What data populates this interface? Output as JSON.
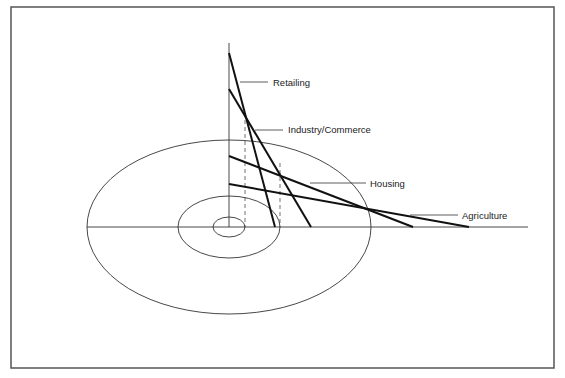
{
  "diagram": {
    "colors": {
      "frame": "#555555",
      "line": "#111111",
      "thin": "#333333"
    },
    "curves": [
      {
        "label": "Retailing",
        "x1": 229,
        "y1": 53,
        "x2": 275,
        "y2": 227,
        "lx1": 240,
        "ly1": 82,
        "lx2": 268,
        "ly2": 82,
        "tx": 273,
        "ty": 86
      },
      {
        "label": "Industry/Commerce",
        "x1": 229,
        "y1": 89,
        "x2": 311,
        "y2": 227,
        "lx1": 255,
        "ly1": 130,
        "lx2": 283,
        "ly2": 130,
        "tx": 288,
        "ty": 133
      },
      {
        "label": "Housing",
        "x1": 229,
        "y1": 156,
        "x2": 413,
        "y2": 227,
        "lx1": 310,
        "ly1": 183,
        "lx2": 366,
        "ly2": 183,
        "tx": 370,
        "ty": 187
      },
      {
        "label": "Agriculture",
        "x1": 229,
        "y1": 184,
        "x2": 469,
        "y2": 227,
        "lx1": 410,
        "ly1": 215,
        "lx2": 458,
        "ly2": 215,
        "tx": 462,
        "ty": 219
      }
    ],
    "zones": [
      {
        "name": "inner",
        "cx": 229,
        "cy": 227,
        "rx": 16,
        "ry": 10
      },
      {
        "name": "middle",
        "cx": 229,
        "cy": 227,
        "rx": 51,
        "ry": 31
      },
      {
        "name": "outer",
        "cx": 229,
        "cy": 227,
        "rx": 142,
        "ry": 87
      }
    ],
    "dashed": [
      {
        "x": 245,
        "y1": 113,
        "y2": 227
      },
      {
        "x": 280,
        "y1": 163,
        "y2": 227
      }
    ],
    "axes": {
      "origin_x": 229,
      "origin_y": 227,
      "v_top": 43,
      "h_left": 87,
      "h_right": 528
    }
  }
}
